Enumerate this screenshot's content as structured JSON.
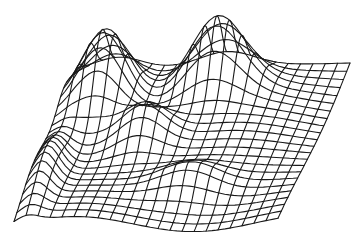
{
  "figure": {
    "kind": "wireframe-surface",
    "background": "#ffffff",
    "line_color": "#1a1a1a",
    "line_width": 1.1
  },
  "mesh": {
    "rows": 22,
    "cols": 22,
    "corners": {
      "front_left": [
        14,
        225
      ],
      "front_right": [
        278,
        223
      ],
      "back_right": [
        350,
        63
      ],
      "back_left": [
        78,
        70
      ]
    },
    "height_scale": 1.0,
    "bumps": [
      {
        "u": 0.15,
        "v": 0.78,
        "amp": 78,
        "su": 0.12,
        "sv": 0.16
      },
      {
        "u": 0.55,
        "v": 0.85,
        "amp": 70,
        "su": 0.14,
        "sv": 0.12
      },
      {
        "u": 0.35,
        "v": 0.55,
        "amp": 38,
        "su": 0.12,
        "sv": 0.12
      },
      {
        "u": 0.05,
        "v": 0.3,
        "amp": 30,
        "su": 0.06,
        "sv": 0.25
      },
      {
        "u": 0.6,
        "v": 0.25,
        "amp": 22,
        "su": 0.15,
        "sv": 0.1
      }
    ]
  }
}
